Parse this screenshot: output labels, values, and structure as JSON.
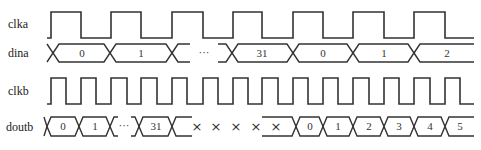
{
  "diagram": {
    "type": "timing-diagram",
    "signals": [
      {
        "name": "clka",
        "kind": "clock",
        "period_px": 61
      },
      {
        "name": "dina",
        "kind": "bus",
        "values": [
          "0",
          "1",
          "···",
          "31",
          "0",
          "1",
          "2"
        ]
      },
      {
        "name": "clkb",
        "kind": "clock",
        "period_px": 30.5
      },
      {
        "name": "doutb",
        "kind": "bus",
        "values": [
          "0",
          "1",
          "···",
          "31",
          "×",
          "×",
          "×",
          "×",
          "×",
          "0",
          "1",
          "2",
          "3",
          "4",
          "5"
        ]
      }
    ],
    "labels": {
      "clka": "clka",
      "dina": "dina",
      "clkb": "clkb",
      "doutb": "doutb"
    },
    "dina_values": {
      "v0": "0",
      "v1": "1",
      "ellipsis": "···",
      "v31": "31",
      "v0b": "0",
      "v1b": "1",
      "v2b": "2"
    },
    "doutb_values": {
      "v0": "0",
      "v1": "1",
      "ellipsis": "···",
      "v31": "31",
      "x1": "×",
      "x2": "×",
      "x3": "×",
      "x4": "×",
      "x5": "×",
      "w0": "0",
      "w1": "1",
      "w2": "2",
      "w3": "3",
      "w4": "4",
      "w5": "5"
    },
    "colors": {
      "line": "#333333",
      "background": "#ffffff"
    }
  }
}
